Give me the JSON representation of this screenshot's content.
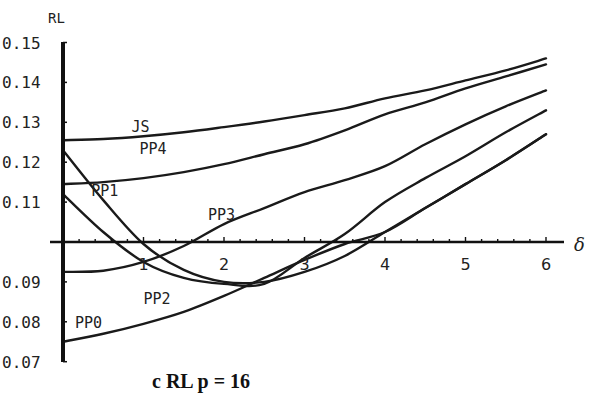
{
  "chart_data": {
    "type": "line",
    "title": "",
    "caption": "c RL  p = 16",
    "xlabel": "δ",
    "ylabel": "RL",
    "xlim": [
      0,
      6
    ],
    "ylim": [
      0.07,
      0.15
    ],
    "x_axis_crosses_y_at": 0.1,
    "grid": false,
    "legend": "inline labels",
    "x_ticks": [
      "1",
      "2",
      "3",
      "4",
      "5",
      "6"
    ],
    "y_ticks": [
      "0.15",
      "0.14",
      "0.13",
      "0.12",
      "0.11",
      "0.09",
      "0.08",
      "0.07"
    ],
    "x": [
      0,
      0.5,
      1,
      1.5,
      2,
      2.5,
      3,
      3.5,
      4,
      4.5,
      5,
      5.5,
      6
    ],
    "series": [
      {
        "name": "JS",
        "values": [
          0.1255,
          0.1258,
          0.1265,
          0.1275,
          0.1288,
          0.1302,
          0.1318,
          0.1335,
          0.136,
          0.138,
          0.1405,
          0.143,
          0.146
        ]
      },
      {
        "name": "PP4",
        "values": [
          0.1145,
          0.115,
          0.116,
          0.1175,
          0.1195,
          0.122,
          0.1245,
          0.128,
          0.132,
          0.135,
          0.1385,
          0.1415,
          0.1445
        ]
      },
      {
        "name": "PP1",
        "values": [
          0.123,
          0.1105,
          0.0995,
          0.093,
          0.09,
          0.09,
          0.0925,
          0.0965,
          0.1025,
          0.1085,
          0.1145,
          0.1205,
          0.127
        ]
      },
      {
        "name": "PP3",
        "values": [
          0.0925,
          0.0928,
          0.095,
          0.099,
          0.1045,
          0.1085,
          0.1125,
          0.1155,
          0.119,
          0.1245,
          0.1295,
          0.134,
          0.138
        ]
      },
      {
        "name": "PP2",
        "values": [
          0.112,
          0.1025,
          0.095,
          0.091,
          0.0895,
          0.0895,
          0.096,
          0.102,
          0.11,
          0.116,
          0.1215,
          0.1275,
          0.133
        ]
      },
      {
        "name": "PP0",
        "values": [
          0.075,
          0.077,
          0.0795,
          0.0825,
          0.0865,
          0.091,
          0.0955,
          0.0995,
          0.1025,
          0.1085,
          0.1145,
          0.1205,
          0.127
        ]
      }
    ],
    "label_positions": {
      "JS": {
        "x": 0.85,
        "y": 0.1275
      },
      "PP4": {
        "x": 0.95,
        "y": 0.122
      },
      "PP1": {
        "x": 0.35,
        "y": 0.1115
      },
      "PP3": {
        "x": 1.8,
        "y": 0.1055
      },
      "PP2": {
        "x": 1.0,
        "y": 0.0845
      },
      "PP0": {
        "x": 0.15,
        "y": 0.0785
      }
    }
  }
}
